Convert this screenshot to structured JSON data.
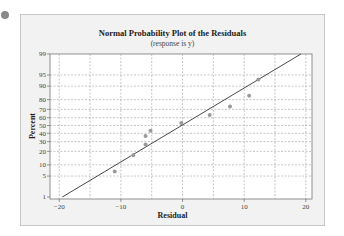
{
  "chart_data": {
    "type": "scatter",
    "title": "Normal Probability Plot of the Residuals",
    "subtitle": "(response is y)",
    "xlabel": "Residual",
    "ylabel": "Percent",
    "xlim": [
      -21.5,
      21
    ],
    "ylim": [
      1,
      99
    ],
    "y_scale": "normal-probability",
    "x_ticks": [
      -20,
      -10,
      0,
      10,
      20
    ],
    "y_ticks": [
      1,
      5,
      10,
      20,
      30,
      40,
      50,
      60,
      70,
      80,
      90,
      95,
      99
    ],
    "grid": true,
    "legend": null,
    "points": [
      {
        "x": -11.0,
        "y": 6.7
      },
      {
        "x": -8.0,
        "y": 16.7
      },
      {
        "x": -6.0,
        "y": 26.7
      },
      {
        "x": -6.0,
        "y": 36.7
      },
      {
        "x": -5.2,
        "y": 43.3
      },
      {
        "x": -0.2,
        "y": 53.3
      },
      {
        "x": 4.4,
        "y": 63.3
      },
      {
        "x": 7.7,
        "y": 73.3
      },
      {
        "x": 10.8,
        "y": 83.3
      },
      {
        "x": 12.3,
        "y": 93.3
      }
    ],
    "fit_line": {
      "x1": -19.5,
      "y1": 1,
      "x2": 19.2,
      "y2": 99
    },
    "colors": {
      "points": "#9a9a9a",
      "line": "#333333",
      "grid": "#a0a0a0",
      "frame_bg": "#f2f2f2",
      "plot_bg": "#ffffff"
    }
  }
}
